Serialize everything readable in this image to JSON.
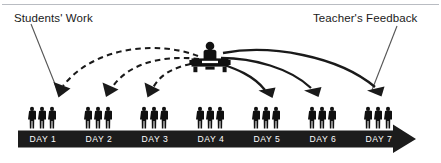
{
  "diagram": {
    "title_left": "Students' Work",
    "title_right": "Teacher's Feedback",
    "colors": {
      "bar": "#1c1c1c",
      "figures": "#111111",
      "arrow_solid": "#1a1a1a",
      "arrow_dashed": "#1a1a1a",
      "leader_line": "#555555",
      "day_label": "#ffffff",
      "background": "#ffffff",
      "top_rule": "#b9bcc2"
    },
    "timeline": {
      "days": [
        {
          "label": "DAY 1",
          "index": 1,
          "students": 3,
          "flow": "students-work",
          "arrow_style": "dashed"
        },
        {
          "label": "DAY 2",
          "index": 2,
          "students": 3,
          "flow": "students-work",
          "arrow_style": "dashed"
        },
        {
          "label": "DAY 3",
          "index": 3,
          "students": 3,
          "flow": "students-work",
          "arrow_style": "dashed"
        },
        {
          "label": "DAY 4",
          "index": 4,
          "students": 3,
          "flow": "none",
          "arrow_style": "none"
        },
        {
          "label": "DAY 5",
          "index": 5,
          "students": 3,
          "flow": "teacher-feedback",
          "arrow_style": "solid"
        },
        {
          "label": "DAY 6",
          "index": 6,
          "students": 3,
          "flow": "teacher-feedback",
          "arrow_style": "solid"
        },
        {
          "label": "DAY 7",
          "index": 7,
          "students": 3,
          "flow": "teacher-feedback",
          "arrow_style": "solid"
        }
      ]
    },
    "teacher": {
      "position_day": 4,
      "icon": "teacher-at-desk-icon"
    },
    "arrow_direction": "left-to-right"
  }
}
